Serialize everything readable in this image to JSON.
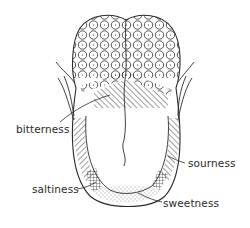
{
  "diagram": {
    "colors": {
      "ink": "#2b2b2b",
      "background": "#ffffff"
    },
    "labels": [
      {
        "id": "bitterness",
        "text": "bitterness",
        "region": "back of tongue (hatched band behind vallate papillae)"
      },
      {
        "id": "sourness",
        "text": "sourness",
        "region": "right side edge"
      },
      {
        "id": "saltiness",
        "text": "saltiness",
        "region": "left front edge (cross-hatched)"
      },
      {
        "id": "sweetness",
        "text": "sweetness",
        "region": "tip of tongue (stippled)"
      }
    ]
  }
}
